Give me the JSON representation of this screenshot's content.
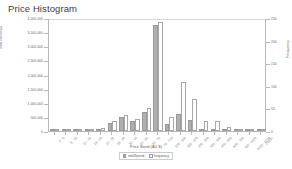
{
  "chart_data": {
    "type": "bar",
    "title": "Price Histogram",
    "xlabel": "Price Band (AU $)",
    "ylabel": "Total Revenue",
    "ylabel_right": "Frequency",
    "grid": false,
    "legend_position": "bottom",
    "categories": [
      "0 - 5",
      "5 - 10",
      "10 - 15",
      "15 - 20",
      "20 - 25",
      "25 - 30",
      "30 - 40",
      "40 - 50",
      "50 - 75",
      "75 - 100",
      "100 - 150",
      "150 - 200",
      "200 - 300",
      "300 - 400",
      "400 - 500",
      "500 - 750",
      "750 - 1000",
      "1000 - 2000",
      "2000+"
    ],
    "ylim": [
      0,
      4000000
    ],
    "ylim_right": [
      0,
      250
    ],
    "yticks": [
      0,
      500000,
      1000000,
      1500000,
      2000000,
      2500000,
      3000000,
      3500000,
      4000000
    ],
    "ytick_labels": [
      "0",
      "500,000",
      "1,000,000",
      "1,500,000",
      "2,000,000",
      "2,500,000",
      "3,000,000",
      "3,500,000",
      "4,000,000"
    ],
    "yticks_right": [
      0,
      50,
      100,
      150,
      200,
      250
    ],
    "ytick_labels_right": [
      "0",
      "50",
      "100",
      "150",
      "200",
      "250"
    ],
    "series": [
      {
        "name": "Total Revenue",
        "axis": "left",
        "color": "#b0b0b0",
        "values": [
          8000,
          12000,
          20000,
          35000,
          60000,
          300000,
          500000,
          340000,
          680000,
          3750000,
          250000,
          620000,
          400000,
          60000,
          30000,
          20000,
          12000,
          8000,
          5000
        ]
      },
      {
        "name": "Frequency",
        "axis": "right",
        "color": "#ffffff",
        "values": [
          2,
          3,
          4,
          5,
          6,
          22,
          36,
          26,
          50,
          242,
          30,
          108,
          70,
          22,
          22,
          8,
          5,
          3,
          2
        ]
      }
    ]
  },
  "legend": {
    "entries": [
      {
        "label": "totalSpend",
        "color": "#b0b0b0"
      },
      {
        "label": "frequency",
        "color": "#ffffff"
      }
    ]
  }
}
